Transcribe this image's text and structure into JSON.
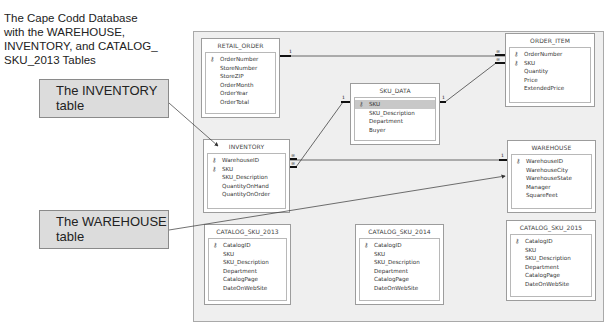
{
  "caption": "The Cape Codd Database\nwith the WAREHOUSE,\nINVENTORY, and CATALOG_\nSKU_2013 Tables",
  "callouts": {
    "inventory": "The INVENTORY\ntable",
    "warehouse": "The WAREHOUSE\ntable"
  },
  "icons": {
    "primary_key": "key-icon"
  },
  "tables": {
    "retail_order": {
      "name": "RETAIL_ORDER",
      "fields": [
        {
          "name": "OrderNumber",
          "key": true
        },
        {
          "name": "StoreNumber",
          "key": false
        },
        {
          "name": "StoreZIP",
          "key": false
        },
        {
          "name": "OrderMonth",
          "key": false
        },
        {
          "name": "OrderYear",
          "key": false
        },
        {
          "name": "OrderTotal",
          "key": false
        }
      ]
    },
    "sku_data": {
      "name": "SKU_DATA",
      "fields": [
        {
          "name": "SKU",
          "key": true,
          "selected": true
        },
        {
          "name": "SKU_Description",
          "key": false
        },
        {
          "name": "Department",
          "key": false
        },
        {
          "name": "Buyer",
          "key": false
        }
      ]
    },
    "order_item": {
      "name": "ORDER_ITEM",
      "fields": [
        {
          "name": "OrderNumber",
          "key": true
        },
        {
          "name": "SKU",
          "key": true
        },
        {
          "name": "Quantity",
          "key": false
        },
        {
          "name": "Price",
          "key": false
        },
        {
          "name": "ExtendedPrice",
          "key": false
        }
      ]
    },
    "inventory": {
      "name": "INVENTORY",
      "fields": [
        {
          "name": "WarehouseID",
          "key": true
        },
        {
          "name": "SKU",
          "key": true
        },
        {
          "name": "SKU_Description",
          "key": false
        },
        {
          "name": "QuantityOnHand",
          "key": false
        },
        {
          "name": "QuantityOnOrder",
          "key": false
        }
      ]
    },
    "warehouse": {
      "name": "WAREHOUSE",
      "fields": [
        {
          "name": "WarehouseID",
          "key": true
        },
        {
          "name": "WarehouseCity",
          "key": false
        },
        {
          "name": "WarehouseState",
          "key": false
        },
        {
          "name": "Manager",
          "key": false
        },
        {
          "name": "SquareFeet",
          "key": false
        }
      ]
    },
    "catalog_sku_2013": {
      "name": "CATALOG_SKU_2013",
      "fields": [
        {
          "name": "CatalogID",
          "key": true
        },
        {
          "name": "SKU",
          "key": false
        },
        {
          "name": "SKU_Description",
          "key": false
        },
        {
          "name": "Department",
          "key": false
        },
        {
          "name": "CatalogPage",
          "key": false
        },
        {
          "name": "DateOnWebSite",
          "key": false
        }
      ]
    },
    "catalog_sku_2014": {
      "name": "CATALOG_SKU_2014",
      "fields": [
        {
          "name": "CatalogID",
          "key": true
        },
        {
          "name": "SKU",
          "key": false
        },
        {
          "name": "SKU_Description",
          "key": false
        },
        {
          "name": "Department",
          "key": false
        },
        {
          "name": "CatalogPage",
          "key": false
        },
        {
          "name": "DateOnWebSite",
          "key": false
        }
      ]
    },
    "catalog_sku_2015": {
      "name": "CATALOG_SKU_2015",
      "fields": [
        {
          "name": "CatalogID",
          "key": true
        },
        {
          "name": "SKU",
          "key": false
        },
        {
          "name": "SKU_Description",
          "key": false
        },
        {
          "name": "Department",
          "key": false
        },
        {
          "name": "CatalogPage",
          "key": false
        },
        {
          "name": "DateOnWebSite",
          "key": false
        }
      ]
    }
  },
  "relationships": [
    {
      "from": "RETAIL_ORDER",
      "to": "ORDER_ITEM",
      "one": "1",
      "many": "∞"
    },
    {
      "from": "SKU_DATA",
      "to": "ORDER_ITEM",
      "one": "1",
      "many": "∞"
    },
    {
      "from": "SKU_DATA",
      "to": "INVENTORY",
      "one": "1",
      "many": "∞"
    },
    {
      "from": "WAREHOUSE",
      "to": "INVENTORY",
      "one": "1",
      "many": "∞"
    }
  ],
  "markers": {
    "one": "1",
    "many": "∞"
  }
}
